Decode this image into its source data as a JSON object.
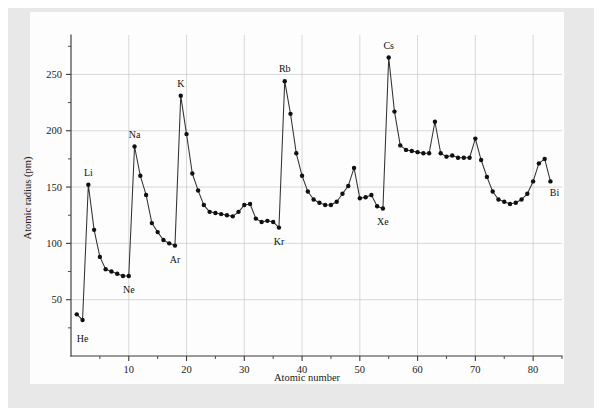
{
  "figure": {
    "background_color": "#e8e8e8",
    "canvas_color": "#fdfdfd",
    "line_color": "#323232",
    "grid_color": "#c9c9c9",
    "axis_color": "#3a3a3a"
  },
  "chart_data": {
    "type": "line",
    "title": "",
    "xlabel": "Atomic number",
    "ylabel": "Atomic radius (pm)",
    "xlim": [
      0,
      85
    ],
    "ylim": [
      0,
      285
    ],
    "grid": true,
    "legend": "none",
    "x_major_ticks": [
      10,
      20,
      30,
      40,
      50,
      60,
      70,
      80
    ],
    "x_minor_ticks": [
      5,
      15,
      25,
      35,
      45,
      55,
      65,
      75,
      85
    ],
    "x_tick_labels": [
      "10",
      "20",
      "30",
      "40",
      "50",
      "60",
      "70",
      "80"
    ],
    "y_major_ticks": [
      50,
      100,
      150,
      200,
      250
    ],
    "y_minor_ticks": [
      25,
      75,
      125,
      175,
      225,
      275
    ],
    "y_tick_labels": [
      "50",
      "100",
      "150",
      "200",
      "250"
    ],
    "marker": "filled-circle",
    "x": [
      1,
      2,
      3,
      4,
      5,
      6,
      7,
      8,
      9,
      10,
      11,
      12,
      13,
      14,
      15,
      16,
      17,
      18,
      19,
      20,
      21,
      22,
      23,
      24,
      25,
      26,
      27,
      28,
      29,
      30,
      31,
      32,
      33,
      34,
      35,
      36,
      37,
      38,
      39,
      40,
      41,
      42,
      43,
      44,
      45,
      46,
      47,
      48,
      49,
      50,
      51,
      52,
      53,
      54,
      55,
      56,
      57,
      58,
      59,
      60,
      61,
      62,
      63,
      64,
      65,
      66,
      67,
      68,
      69,
      70,
      71,
      72,
      73,
      74,
      75,
      76,
      77,
      78,
      79,
      80,
      81,
      82,
      83
    ],
    "y": [
      37,
      32,
      152,
      112,
      88,
      77,
      75,
      73,
      71,
      71,
      186,
      160,
      143,
      118,
      110,
      103,
      100,
      98,
      231,
      197,
      162,
      147,
      134,
      128,
      127,
      126,
      125,
      124,
      128,
      134,
      135,
      122,
      119,
      120,
      119,
      114,
      244,
      215,
      180,
      160,
      146,
      139,
      136,
      134,
      134,
      137,
      144,
      151,
      167,
      140,
      141,
      143,
      133,
      131,
      265,
      217,
      187,
      183,
      182,
      181,
      180,
      180,
      208,
      180,
      177,
      178,
      176,
      176,
      176,
      193,
      174,
      159,
      146,
      139,
      137,
      135,
      136,
      139,
      144,
      155,
      171,
      175,
      155
    ],
    "series_name": "Atomic radius",
    "annotations": [
      {
        "label": "He",
        "x": 2,
        "y": 32,
        "dx": 0,
        "dy": 22
      },
      {
        "label": "Li",
        "x": 3,
        "y": 152,
        "dx": 0,
        "dy": -9
      },
      {
        "label": "Ne",
        "x": 10,
        "y": 71,
        "dx": 0,
        "dy": 17
      },
      {
        "label": "Na",
        "x": 11,
        "y": 186,
        "dx": 0,
        "dy": -9
      },
      {
        "label": "Ar",
        "x": 18,
        "y": 98,
        "dx": 0,
        "dy": 17
      },
      {
        "label": "K",
        "x": 19,
        "y": 231,
        "dx": 0,
        "dy": -9
      },
      {
        "label": "Kr",
        "x": 36,
        "y": 114,
        "dx": 0,
        "dy": 17
      },
      {
        "label": "Rb",
        "x": 37,
        "y": 244,
        "dx": 0,
        "dy": -9
      },
      {
        "label": "Xe",
        "x": 54,
        "y": 131,
        "dx": 0,
        "dy": 17
      },
      {
        "label": "Cs",
        "x": 55,
        "y": 265,
        "dx": 0,
        "dy": -9
      },
      {
        "label": "Bi",
        "x": 83,
        "y": 155,
        "dx": 4,
        "dy": 15
      }
    ]
  }
}
